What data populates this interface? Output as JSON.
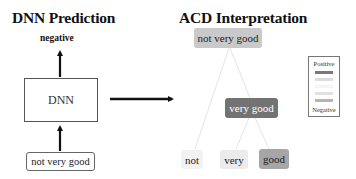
{
  "left_panel": {
    "title": "DNN Prediction",
    "prediction_label": "negative",
    "model_label": "DNN",
    "input_text": "not very good"
  },
  "right_panel": {
    "title": "ACD Interpretation",
    "tree": {
      "root": {
        "label": "not very good",
        "color": "#c9c9c9",
        "text_color": "#222222"
      },
      "mid": {
        "label": "very good",
        "color": "#737373",
        "text_color": "#ffffff"
      },
      "leaves": [
        {
          "label": "not",
          "color": "#f2f2f2",
          "text_color": "#222222"
        },
        {
          "label": "very",
          "color": "#ebebeb",
          "text_color": "#222222"
        },
        {
          "label": "good",
          "color": "#a6a6a6",
          "text_color": "#222222"
        }
      ]
    },
    "legend": {
      "top_label": "Positive",
      "bottom_label": "Negative",
      "scale_colors": [
        "#7a7a7a",
        "#d9d9d9",
        "#f4f4f4",
        "#e2e2e2",
        "#b5b5b5"
      ]
    }
  },
  "colors": {
    "arrow": "#111111",
    "tree_edge": "#e2e2e2"
  }
}
